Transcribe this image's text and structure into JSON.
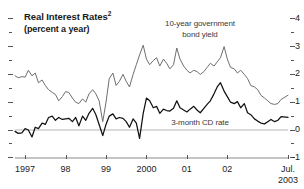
{
  "title": {
    "main": "Real Interest Rates",
    "superscript": "2",
    "subtitle": "(percent a year)"
  },
  "annotations": {
    "bond_line1": "10-year government",
    "bond_line2": "bond yield",
    "cd": "3-month CD rate"
  },
  "axis": {
    "y_ticks": [
      "4",
      "3",
      "2",
      "1",
      "0",
      "-1"
    ],
    "x_ticks": [
      "1997",
      "98",
      "99",
      "2000",
      "01",
      "02",
      "Jul."
    ],
    "x_last_year": "2003"
  },
  "colors": {
    "bond_line": "#6e6e6e",
    "cd_line": "#111111",
    "zero_line": "#b5b5b5",
    "axis": "#8a8a8a",
    "text": "#1a1a1a"
  },
  "chart_data": {
    "type": "line",
    "xlabel": "",
    "ylabel": "percent a year",
    "ylim": [
      -1,
      4
    ],
    "xlim": [
      1996.75,
      2003.5
    ],
    "grid": false,
    "legend": "inline-annotations",
    "x_tick_labels": [
      "1997",
      "98",
      "99",
      "2000",
      "01",
      "02",
      "Jul. 2003"
    ],
    "x_tick_values": [
      1997,
      1998,
      1999,
      2000,
      2001,
      2002,
      2003.5
    ],
    "y_tick_values": [
      4,
      3,
      2,
      1,
      0,
      -1
    ],
    "series": [
      {
        "name": "10-year government bond yield",
        "color": "#6e6e6e",
        "x": [
          1996.75,
          1996.83,
          1996.92,
          1997.0,
          1997.08,
          1997.17,
          1997.25,
          1997.33,
          1997.42,
          1997.5,
          1997.58,
          1997.67,
          1997.75,
          1997.83,
          1997.92,
          1998.0,
          1998.08,
          1998.17,
          1998.25,
          1998.33,
          1998.42,
          1998.5,
          1998.58,
          1998.67,
          1998.75,
          1998.83,
          1998.92,
          1999.0,
          1999.08,
          1999.17,
          1999.25,
          1999.33,
          1999.42,
          1999.5,
          1999.58,
          1999.67,
          1999.75,
          1999.83,
          1999.92,
          2000.0,
          2000.08,
          2000.17,
          2000.25,
          2000.33,
          2000.42,
          2000.5,
          2000.58,
          2000.67,
          2000.75,
          2000.83,
          2000.92,
          2001.0,
          2001.08,
          2001.17,
          2001.25,
          2001.33,
          2001.42,
          2001.5,
          2001.58,
          2001.67,
          2001.75,
          2001.83,
          2001.92,
          2002.0,
          2002.08,
          2002.17,
          2002.25,
          2002.33,
          2002.42,
          2002.5,
          2002.58,
          2002.67,
          2002.75,
          2002.83,
          2002.92,
          2003.0,
          2003.08,
          2003.17,
          2003.25,
          2003.33,
          2003.5
        ],
        "y": [
          1.95,
          1.88,
          1.92,
          1.9,
          2.15,
          1.95,
          2.05,
          1.7,
          1.8,
          1.6,
          1.45,
          1.35,
          1.28,
          1.05,
          1.2,
          1.38,
          1.35,
          1.15,
          1.0,
          0.95,
          1.12,
          1.0,
          1.3,
          1.45,
          1.3,
          1.05,
          0.3,
          1.0,
          1.85,
          2.05,
          1.6,
          1.75,
          2.0,
          1.75,
          1.55,
          2.0,
          2.35,
          2.7,
          3.05,
          2.55,
          2.35,
          2.5,
          2.6,
          2.3,
          2.55,
          2.4,
          2.2,
          2.35,
          2.95,
          2.55,
          2.3,
          2.15,
          2.05,
          2.15,
          2.1,
          2.0,
          2.1,
          2.25,
          2.4,
          2.3,
          2.45,
          2.6,
          3.0,
          2.55,
          2.25,
          2.2,
          2.05,
          2.15,
          2.0,
          1.85,
          1.6,
          1.55,
          1.45,
          1.25,
          1.15,
          1.05,
          0.95,
          0.92,
          0.95,
          1.1,
          1.25
        ]
      },
      {
        "name": "3-month CD rate",
        "color": "#111111",
        "x": [
          1996.75,
          1996.83,
          1996.92,
          1997.0,
          1997.08,
          1997.17,
          1997.25,
          1997.33,
          1997.42,
          1997.5,
          1997.58,
          1997.67,
          1997.75,
          1997.83,
          1997.92,
          1998.0,
          1998.08,
          1998.17,
          1998.25,
          1998.33,
          1998.42,
          1998.5,
          1998.58,
          1998.67,
          1998.75,
          1998.83,
          1998.92,
          1999.0,
          1999.08,
          1999.17,
          1999.25,
          1999.33,
          1999.42,
          1999.5,
          1999.58,
          1999.67,
          1999.75,
          1999.83,
          1999.92,
          2000.0,
          2000.08,
          2000.17,
          2000.25,
          2000.33,
          2000.42,
          2000.5,
          2000.58,
          2000.67,
          2000.75,
          2000.83,
          2000.92,
          2001.0,
          2001.08,
          2001.17,
          2001.25,
          2001.33,
          2001.42,
          2001.5,
          2001.58,
          2001.67,
          2001.75,
          2001.83,
          2001.92,
          2002.0,
          2002.08,
          2002.17,
          2002.25,
          2002.33,
          2002.42,
          2002.5,
          2002.58,
          2002.67,
          2002.75,
          2002.83,
          2002.92,
          2003.0,
          2003.08,
          2003.17,
          2003.25,
          2003.33,
          2003.5
        ],
        "y": [
          -0.05,
          -0.12,
          -0.1,
          0.05,
          0.0,
          -0.25,
          0.1,
          0.05,
          0.25,
          0.2,
          0.45,
          0.5,
          0.35,
          0.45,
          0.38,
          0.4,
          0.42,
          0.3,
          0.45,
          0.15,
          0.5,
          0.35,
          0.6,
          0.78,
          0.55,
          0.2,
          -0.2,
          0.2,
          0.5,
          0.58,
          0.4,
          0.45,
          0.42,
          0.3,
          0.1,
          0.4,
          0.25,
          -0.3,
          0.6,
          1.15,
          1.05,
          0.8,
          0.85,
          0.6,
          0.75,
          0.7,
          0.68,
          0.78,
          1.05,
          0.8,
          0.72,
          0.65,
          0.75,
          0.85,
          0.72,
          0.62,
          0.78,
          0.92,
          1.05,
          1.3,
          1.55,
          1.7,
          1.4,
          1.2,
          1.0,
          0.95,
          1.02,
          0.8,
          0.95,
          0.62,
          0.55,
          0.4,
          0.32,
          0.25,
          0.22,
          0.3,
          0.38,
          0.3,
          0.35,
          0.48,
          0.45
        ]
      }
    ]
  }
}
